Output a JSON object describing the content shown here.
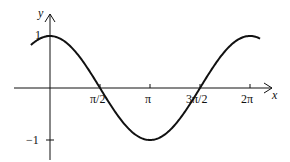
{
  "chart_data": {
    "type": "line",
    "title": "",
    "function": "y = cos(x)",
    "xlabel": "x",
    "ylabel": "y",
    "x_ticks": [
      "π/2",
      "π",
      "3π/2",
      "2π"
    ],
    "y_ticks": [
      "1",
      "−1"
    ],
    "xlim": [
      -0.6,
      6.6
    ],
    "ylim": [
      -1.3,
      1.3
    ],
    "grid": false,
    "series": [
      {
        "name": "cos x",
        "x": [
          -0.6,
          0,
          0.785,
          1.571,
          2.356,
          3.142,
          3.927,
          4.712,
          5.498,
          6.283,
          6.6
        ],
        "values": [
          0.83,
          1,
          0.71,
          0,
          -0.71,
          -1,
          -0.71,
          0,
          0.71,
          1,
          0.95
        ]
      }
    ]
  },
  "labels": {
    "y_axis": "y",
    "x_axis": "x",
    "y_one": "1",
    "y_neg_one": "−1",
    "tick_pi_2": "π/2",
    "tick_pi": "π",
    "tick_3pi_2": "3π/2",
    "tick_2pi": "2π"
  }
}
